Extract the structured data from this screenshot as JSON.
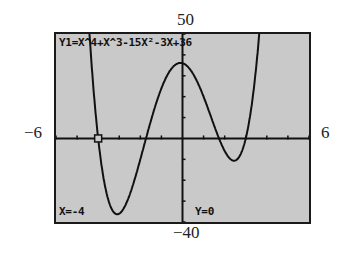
{
  "window": {
    "ymax_label": "50",
    "ymin_label": "−40",
    "xmin_label": "−6",
    "xmax_label": "6"
  },
  "screen": {
    "function_label": "Y1=X^4+X^3-15X²-3X+36",
    "x_readout": "X=-4",
    "y_readout": "Y=0",
    "background": "#c9c9c9",
    "curve_color": "#111111"
  },
  "chart_data": {
    "type": "line",
    "xlabel": "",
    "ylabel": "",
    "xlim": [
      -6,
      6
    ],
    "ylim": [
      -40,
      50
    ],
    "xtick_step": 1,
    "ytick_step": 10,
    "grid": false,
    "coefficients": [
      1,
      1,
      -15,
      -3,
      36
    ],
    "trace_point": {
      "x": -4,
      "y": 0
    },
    "series": [
      {
        "name": "Y1",
        "x": [
          -4.5,
          -4.25,
          -4,
          -3.75,
          -3.5,
          -3.25,
          -3,
          -2.75,
          -2.5,
          -2.25,
          -2,
          -1.75,
          -1.5,
          -1.25,
          -1,
          -0.75,
          -0.5,
          -0.25,
          0,
          0.25,
          0.5,
          0.75,
          1,
          1.25,
          1.5,
          1.75,
          2,
          2.25,
          2.5,
          2.75,
          3,
          3.25,
          3.5
        ],
        "values": [
          41.06,
          19.01,
          0,
          -15.19,
          -26.81,
          -34.37,
          -36,
          -33.58,
          -27.06,
          -17.77,
          -6,
          5.81,
          17.44,
          27.03,
          35,
          37.83,
          36.25,
          34.22,
          36,
          34.14,
          31.31,
          27.08,
          20,
          10.42,
          0.19,
          -9.07,
          -18,
          -18.92,
          -18.06,
          -9.99,
          0,
          14.04,
          33.81
        ]
      }
    ]
  }
}
